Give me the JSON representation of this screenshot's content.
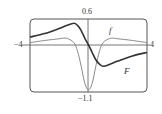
{
  "chart_data": {
    "type": "line",
    "title": "",
    "xlabel": "",
    "ylabel": "",
    "xlim": [
      -4,
      4
    ],
    "ylim": [
      -1.1,
      0.6
    ],
    "x_tick_labels": [
      "-4",
      "4"
    ],
    "y_tick_labels": [
      "0.6",
      "-1.1"
    ],
    "grid": false,
    "legend": "inline curve labels",
    "series": [
      {
        "name": "F",
        "style": "thick dark",
        "x": [
          -4,
          -3,
          -2,
          -1.5,
          -1,
          -0.75,
          -0.5,
          -0.25,
          0,
          0.25,
          0.5,
          0.75,
          1,
          1.5,
          2,
          3,
          4
        ],
        "y": [
          0.18,
          0.26,
          0.38,
          0.45,
          0.5,
          0.45,
          0.33,
          0.15,
          0,
          -0.18,
          -0.35,
          -0.45,
          -0.5,
          -0.45,
          -0.38,
          -0.26,
          -0.18
        ]
      },
      {
        "name": "f",
        "style": "thin gray",
        "x": [
          -4,
          -3,
          -2,
          -1.5,
          -1,
          -0.75,
          -0.5,
          -0.25,
          0,
          0.25,
          0.5,
          0.75,
          1,
          1.5,
          2,
          3,
          4
        ],
        "y": [
          0.05,
          0.1,
          0.14,
          0.15,
          0.05,
          -0.15,
          -0.5,
          -0.9,
          -1.05,
          -0.9,
          -0.5,
          -0.15,
          0.05,
          0.15,
          0.14,
          0.1,
          0.05
        ]
      }
    ]
  },
  "labels": {
    "ymax": "0.6",
    "ymin": "−1.1",
    "xmin": "−4",
    "xmax": "4",
    "f": "f",
    "F": "F"
  }
}
